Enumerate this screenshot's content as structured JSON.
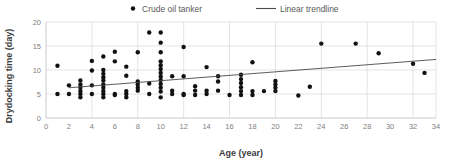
{
  "chart_data": {
    "type": "scatter",
    "title": "",
    "xlabel": "Age (year)",
    "ylabel": "Drydocking time (day)",
    "xlim": [
      0,
      34
    ],
    "ylim": [
      0,
      20
    ],
    "xticks": [
      0,
      2,
      4,
      6,
      8,
      10,
      12,
      14,
      16,
      18,
      20,
      22,
      24,
      26,
      28,
      30,
      32,
      34
    ],
    "yticks": [
      0,
      5,
      10,
      15,
      20
    ],
    "grid": true,
    "legend_position": "top-center",
    "marker_color": "#111111",
    "trendline_color": "#4a4a4a",
    "legend": [
      {
        "label": "Crude oil tanker",
        "marker": "dot",
        "color": "#111111"
      },
      {
        "label": "Linear trendline",
        "marker": "line",
        "color": "#4a4a4a"
      }
    ],
    "series": [
      {
        "name": "Crude oil tanker",
        "marker": "dot",
        "points": [
          [
            1,
            10.9
          ],
          [
            1,
            5.0
          ],
          [
            2,
            6.8
          ],
          [
            2,
            5.0
          ],
          [
            3,
            7.8
          ],
          [
            3,
            7.0
          ],
          [
            3,
            6.3
          ],
          [
            3,
            5.6
          ],
          [
            3,
            5.0
          ],
          [
            3,
            4.3
          ],
          [
            4,
            11.9
          ],
          [
            4,
            9.9
          ],
          [
            4,
            6.8
          ],
          [
            4,
            5.0
          ],
          [
            5,
            12.8
          ],
          [
            5,
            10.0
          ],
          [
            5,
            9.2
          ],
          [
            5,
            8.5
          ],
          [
            5,
            7.8
          ],
          [
            5,
            7.0
          ],
          [
            5,
            6.3
          ],
          [
            5,
            5.6
          ],
          [
            5,
            5.0
          ],
          [
            5,
            4.3
          ],
          [
            6,
            13.8
          ],
          [
            6,
            11.8
          ],
          [
            6,
            5.0
          ],
          [
            6,
            4.8
          ],
          [
            7,
            10.7
          ],
          [
            7,
            8.8
          ],
          [
            7,
            5.6
          ],
          [
            7,
            5.0
          ],
          [
            7,
            4.3
          ],
          [
            8,
            13.7
          ],
          [
            8,
            7.6
          ],
          [
            8,
            7.0
          ],
          [
            8,
            6.3
          ],
          [
            8,
            5.7
          ],
          [
            9,
            17.8
          ],
          [
            9,
            7.2
          ],
          [
            9,
            5.0
          ],
          [
            10,
            17.8
          ],
          [
            10,
            15.7
          ],
          [
            10,
            13.7
          ],
          [
            10,
            11.8
          ],
          [
            10,
            11.0
          ],
          [
            10,
            10.2
          ],
          [
            10,
            9.4
          ],
          [
            10,
            8.6
          ],
          [
            10,
            7.9
          ],
          [
            10,
            7.1
          ],
          [
            10,
            6.3
          ],
          [
            10,
            5.5
          ],
          [
            10,
            4.3
          ],
          [
            11,
            8.7
          ],
          [
            11,
            5.7
          ],
          [
            11,
            5.0
          ],
          [
            12,
            14.8
          ],
          [
            12,
            8.7
          ],
          [
            12,
            5.0
          ],
          [
            12,
            4.8
          ],
          [
            13,
            6.6
          ],
          [
            13,
            5.7
          ],
          [
            13,
            4.8
          ],
          [
            14,
            10.6
          ],
          [
            14,
            5.7
          ],
          [
            14,
            5.0
          ],
          [
            15,
            8.7
          ],
          [
            15,
            7.6
          ],
          [
            15,
            5.7
          ],
          [
            16,
            4.8
          ],
          [
            17,
            9.0
          ],
          [
            17,
            8.1
          ],
          [
            17,
            7.3
          ],
          [
            17,
            6.4
          ],
          [
            17,
            5.6
          ],
          [
            17,
            4.8
          ],
          [
            18,
            11.6
          ],
          [
            18,
            5.6
          ],
          [
            18,
            4.8
          ],
          [
            19,
            5.6
          ],
          [
            20,
            7.7
          ],
          [
            20,
            7.0
          ],
          [
            20,
            6.3
          ],
          [
            20,
            5.6
          ],
          [
            22,
            4.7
          ],
          [
            23,
            6.5
          ],
          [
            24,
            15.5
          ],
          [
            27,
            15.5
          ],
          [
            29,
            13.5
          ],
          [
            32,
            11.3
          ],
          [
            33,
            9.4
          ]
        ]
      }
    ],
    "trendline": {
      "name": "Linear trendline",
      "x_start": 2,
      "y_start": 6.3,
      "x_end": 34,
      "y_end": 12.2
    }
  }
}
